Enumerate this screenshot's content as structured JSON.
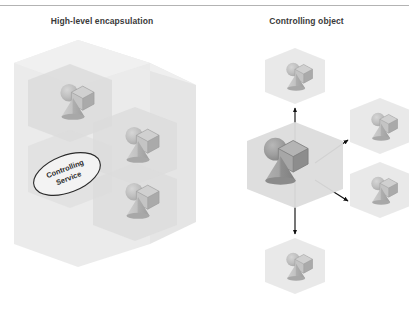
{
  "figure": {
    "type": "diagram",
    "background": "#ffffff",
    "divider_color": "#9a9a9a",
    "panels": [
      {
        "id": "left",
        "title": "High-level encapsulation",
        "description": "Large translucent hexagonal prism enclosing three nested hexagonal cells, each containing a sphere, a cube and a cone; an oval labelled Controlling Service sits inside the prism.",
        "callout": {
          "line1": "Controlling",
          "line2": "Service"
        }
      },
      {
        "id": "right",
        "title": "Controlling object",
        "description": "A large central hexagon containing a sphere, cube and cone, linked by four arrows to four smaller satellite hexagons.",
        "arrow_count": 4,
        "satellite_count": 4
      }
    ]
  },
  "shapes": {
    "sphere_label": "sphere",
    "cube_label": "cube",
    "cone_label": "cone"
  },
  "colors": {
    "prism_outer": "#e8e8e8",
    "prism_outer_top": "#efefef",
    "prism_outer_side": "#dedede",
    "cell_fill": "#e0e0e0",
    "cell_fill_light": "#ebebeb",
    "shape_light": "#c9c9c9",
    "shape_mid": "#b6b6b6",
    "shape_dark": "#a2a2a2",
    "center_shape_dark": "#9a9a9a",
    "center_shape_darker": "#8a8a8a",
    "arrow": "#111111",
    "title_text": "#3a3a3a",
    "callout_stroke": "#2b2b2b",
    "callout_fill": "#f4f4f4"
  }
}
